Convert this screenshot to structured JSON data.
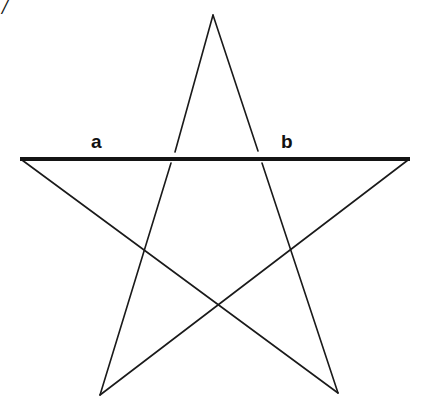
{
  "figure": {
    "type": "pentagram-with-horizontal-bar",
    "colors": {
      "line": "#1a1a1a",
      "bar": "#141414",
      "background": "#ffffff"
    },
    "points": {
      "apex": [
        213,
        15
      ],
      "left_tip": [
        20,
        159
      ],
      "right_tip": [
        410,
        159
      ],
      "bottom_left": [
        100,
        395
      ],
      "bottom_right": [
        338,
        393
      ]
    },
    "labels": {
      "a": {
        "text": "a",
        "x": 91,
        "y": 148
      },
      "b": {
        "text": "b",
        "x": 281,
        "y": 148
      },
      "corner_mark": {
        "text": "/",
        "x": 2,
        "y": 14
      }
    }
  }
}
